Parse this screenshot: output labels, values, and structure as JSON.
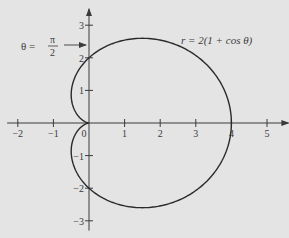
{
  "chart_data": {
    "type": "line",
    "subtype": "polar-curve",
    "title": "",
    "equation_label": "r = 2(1 + cos θ)",
    "annotation": {
      "label_theta": "θ =",
      "label_num": "π",
      "label_den": "2",
      "points_to": [
        0,
        2.4
      ]
    },
    "x_ticks": [
      -2,
      -1,
      0,
      1,
      2,
      3,
      4,
      5
    ],
    "x_tick_labels": [
      "−2",
      "−1",
      "0",
      "1",
      "2",
      "3",
      "4",
      "5"
    ],
    "y_ticks": [
      -3,
      -2,
      -1,
      1,
      2,
      3
    ],
    "y_tick_labels": [
      "−3",
      "−2",
      "−1",
      "1",
      "2",
      "3"
    ],
    "xlim": [
      -2.3,
      5.6
    ],
    "ylim": [
      -3.3,
      3.5
    ],
    "grid": false,
    "series": [
      {
        "name": "r = 2(1 + cos θ)",
        "polar": "r = 2(1 + cos(theta))",
        "theta_range": [
          0,
          6.2832
        ],
        "key_points": [
          {
            "x": 4,
            "y": 0
          },
          {
            "x": 0,
            "y": 2
          },
          {
            "x": 0,
            "y": 0
          },
          {
            "x": 0,
            "y": -2
          },
          {
            "x": 1.5,
            "y": 2.598
          },
          {
            "x": 1.5,
            "y": -2.598
          },
          {
            "x": -0.25,
            "y": 0.433
          },
          {
            "x": -0.25,
            "y": -0.433
          }
        ]
      }
    ]
  },
  "colors": {
    "background": "#e4e4e4",
    "curve": "#2a2a2a",
    "axis": "#3a3a3a"
  }
}
